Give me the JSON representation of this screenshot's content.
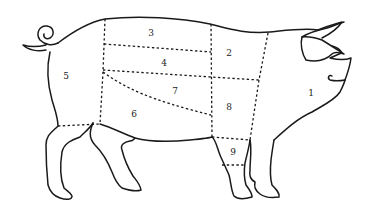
{
  "diagram": {
    "type": "pork-cuts",
    "colors": {
      "line": "#1a1a1a",
      "background": "#ffffff"
    },
    "regions": [
      {
        "id": 1,
        "label": "1",
        "x": 311,
        "y": 93
      },
      {
        "id": 2,
        "label": "2",
        "x": 229,
        "y": 53
      },
      {
        "id": 3,
        "label": "3",
        "x": 151,
        "y": 33
      },
      {
        "id": 4,
        "label": "4",
        "x": 164,
        "y": 64
      },
      {
        "id": 5,
        "label": "5",
        "x": 66,
        "y": 76
      },
      {
        "id": 6,
        "label": "6",
        "x": 134,
        "y": 115
      },
      {
        "id": 7,
        "label": "7",
        "x": 175,
        "y": 92
      },
      {
        "id": 8,
        "label": "8",
        "x": 229,
        "y": 108
      },
      {
        "id": 9,
        "label": "9",
        "x": 233,
        "y": 153
      }
    ]
  }
}
